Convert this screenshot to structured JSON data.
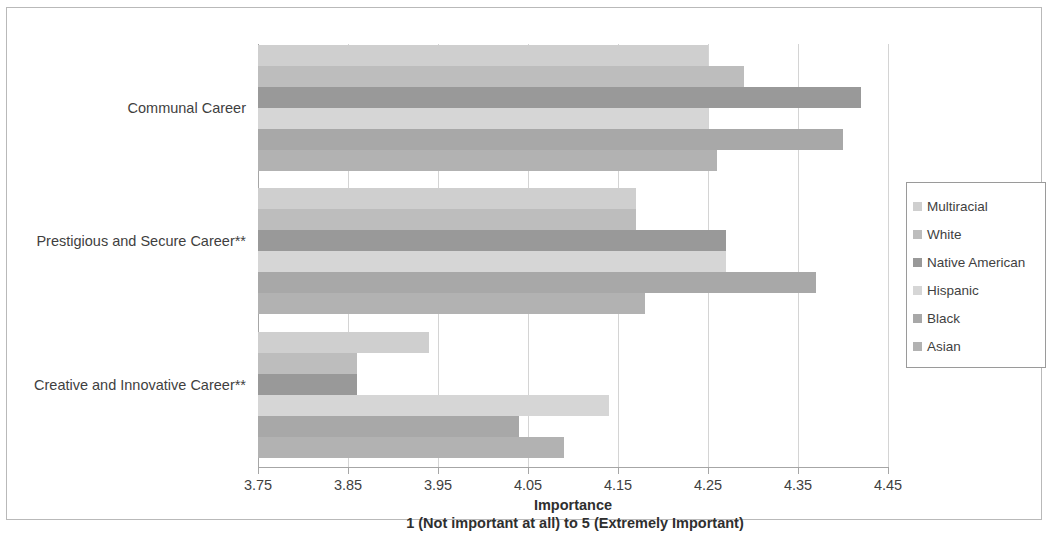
{
  "chart_data": {
    "type": "bar",
    "orientation": "horizontal",
    "title": "",
    "xlabel": "Importance",
    "xlabel_sub": "1 (Not important at all) to 5 (Extremely Important)",
    "ylabel": "",
    "xlim": [
      3.75,
      4.45
    ],
    "xticks": [
      "3.75",
      "3.85",
      "3.95",
      "4.05",
      "4.15",
      "4.25",
      "4.35",
      "4.45"
    ],
    "xtick_values": [
      3.75,
      3.85,
      3.95,
      4.05,
      4.15,
      4.25,
      4.35,
      4.45
    ],
    "grid": "vertical",
    "legend_position": "right",
    "categories": [
      "Communal Career",
      "Prestigious and Secure Career**",
      "Creative and Innovative Career**"
    ],
    "series": [
      {
        "name": "Multiracial",
        "color": "#cfcfcf",
        "values": [
          4.25,
          4.17,
          3.94
        ]
      },
      {
        "name": "White",
        "color": "#bdbdbd",
        "values": [
          4.29,
          4.17,
          3.86
        ]
      },
      {
        "name": "Native American",
        "color": "#999999",
        "values": [
          4.42,
          4.27,
          3.86
        ]
      },
      {
        "name": "Hispanic",
        "color": "#d6d6d6",
        "values": [
          4.25,
          4.27,
          4.14
        ]
      },
      {
        "name": "Black",
        "color": "#a8a8a8",
        "values": [
          4.4,
          4.37,
          4.04
        ]
      },
      {
        "name": "Asian",
        "color": "#b2b2b2",
        "values": [
          4.26,
          4.18,
          4.09
        ]
      }
    ]
  },
  "legend": {
    "items": [
      {
        "label": "Multiracial"
      },
      {
        "label": "White"
      },
      {
        "label": "Native American"
      },
      {
        "label": "Hispanic"
      },
      {
        "label": "Black"
      },
      {
        "label": "Asian"
      }
    ]
  }
}
